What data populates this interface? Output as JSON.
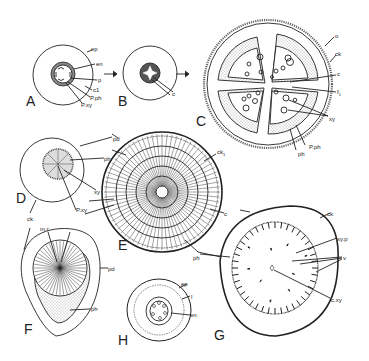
{
  "figure": {
    "panels": [
      {
        "id": "A",
        "label": "A",
        "labels": [
          "ep",
          "en",
          "p",
          "c1",
          "P.ph",
          "P.xy"
        ]
      },
      {
        "id": "B",
        "label": "B",
        "labels": [
          "c"
        ]
      },
      {
        "id": "C",
        "label": "C",
        "labels": [
          "o",
          "ck",
          "c",
          "f1",
          "xy",
          "ph",
          "P.ph"
        ]
      },
      {
        "id": "D",
        "label": "D",
        "labels": [
          "pd",
          "ph",
          "xy",
          "P.xy",
          "ck"
        ]
      },
      {
        "id": "E",
        "label": "E",
        "labels": [
          "ck1",
          "c",
          "ph"
        ]
      },
      {
        "id": "F",
        "label": "F",
        "labels": [
          "ck",
          "m.r",
          "pd",
          "ph"
        ]
      },
      {
        "id": "G",
        "label": "G",
        "labels": [
          "ck",
          "xy.p",
          "v",
          "c.xy",
          "c"
        ]
      },
      {
        "id": "H",
        "label": "H",
        "labels": [
          "ep",
          "l",
          "en"
        ]
      }
    ],
    "text": {
      "A": "A",
      "B": "B",
      "C": "C",
      "D": "D",
      "E": "E",
      "F": "F",
      "G": "G",
      "H": "H",
      "a_ep": "ep",
      "a_en": "en",
      "a_p": "p",
      "a_c1": "c1",
      "a_pph": "P.ph",
      "a_pxy": "P.xy",
      "b_c": "c",
      "c_o": "o",
      "c_ck": "ck",
      "c_c": "c",
      "c_f1": "f",
      "c_f1_sub": "1",
      "c_xy": "xy",
      "c_ph": "ph",
      "c_pph": "P.ph",
      "d_pd": "pd",
      "d_ph": "ph",
      "d_xy": "xy",
      "d_pxy": "P.xy",
      "e_ck1": "ck",
      "e_ck1_sub": "1",
      "e_ph": "ph",
      "f_ck": "ck",
      "f_mr": "m.r",
      "f_pd": "pd",
      "f_ph": "ph",
      "g_c": "c",
      "g_ck": "ck",
      "g_xyp": "xy.p",
      "g_v": "v",
      "g_cxy": "c.xy",
      "h_ep": "ep",
      "h_l": "l",
      "h_en": "en"
    },
    "colors": {
      "ink": "#222222",
      "background": "#ffffff"
    }
  }
}
